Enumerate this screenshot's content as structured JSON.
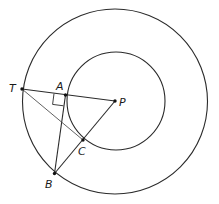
{
  "diagram": {
    "type": "geometry",
    "center": {
      "name": "P",
      "x": 116,
      "y": 101
    },
    "circles": [
      {
        "name": "outer-circle",
        "cx": 115,
        "cy": 101.5,
        "r": 92.5
      },
      {
        "name": "inner-circle",
        "cx": 116,
        "cy": 101,
        "r": 49
      }
    ],
    "points": [
      {
        "name": "T",
        "label": "T",
        "x": 22,
        "y": 89,
        "label_x": 9,
        "label_y": 92
      },
      {
        "name": "A",
        "label": "A",
        "x": 65.5,
        "y": 95,
        "label_x": 56,
        "label_y": 90
      },
      {
        "name": "P",
        "label": "P",
        "x": 115,
        "y": 101,
        "label_x": 119,
        "label_y": 106
      },
      {
        "name": "C",
        "label": "C",
        "x": 83,
        "y": 140,
        "label_x": 78,
        "label_y": 155
      },
      {
        "name": "B",
        "label": "B",
        "x": 54.5,
        "y": 173.5,
        "label_x": 45,
        "label_y": 188
      }
    ],
    "segments": [
      {
        "name": "TP",
        "from": "T",
        "to": "P"
      },
      {
        "name": "AB",
        "from": "A",
        "to": "B"
      },
      {
        "name": "BP",
        "from": "B",
        "to": "P"
      },
      {
        "name": "TC",
        "from": "T",
        "to": "C"
      }
    ],
    "right_angle_marker": {
      "at": "A",
      "between": [
        "TA",
        "AB"
      ]
    }
  }
}
